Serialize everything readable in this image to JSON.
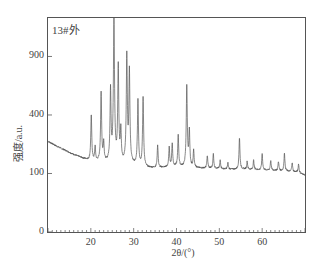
{
  "chart_data": {
    "type": "line",
    "title": "",
    "annotation": "13#外",
    "xlabel": "2θ/(°)",
    "ylabel": "强度/a.u.",
    "xlim": [
      10,
      70
    ],
    "ylim": [
      0,
      1350
    ],
    "yscale": "sqrt",
    "grid": false,
    "legend": null,
    "xticks": [
      20,
      30,
      40,
      50,
      60
    ],
    "yticks": [
      0,
      100,
      400,
      900
    ],
    "series": [
      {
        "name": "13#外",
        "color": "#555555",
        "background": [
          [
            10,
            240
          ],
          [
            12,
            215
          ],
          [
            14,
            195
          ],
          [
            16,
            175
          ],
          [
            18,
            160
          ],
          [
            19.5,
            150
          ],
          [
            21,
            145
          ],
          [
            24,
            140
          ],
          [
            27,
            135
          ],
          [
            30,
            130
          ],
          [
            33,
            120
          ],
          [
            36,
            120
          ],
          [
            40,
            125
          ],
          [
            44,
            120
          ],
          [
            48,
            118
          ],
          [
            52,
            115
          ],
          [
            56,
            115
          ],
          [
            60,
            112
          ],
          [
            64,
            110
          ],
          [
            68,
            105
          ],
          [
            70,
            95
          ]
        ],
        "peaks": [
          {
            "x": 20.1,
            "y": 400
          },
          {
            "x": 21.0,
            "y": 210
          },
          {
            "x": 22.4,
            "y": 570
          },
          {
            "x": 23.0,
            "y": 230
          },
          {
            "x": 24.6,
            "y": 600
          },
          {
            "x": 25.4,
            "y": 1350
          },
          {
            "x": 26.4,
            "y": 820
          },
          {
            "x": 27.0,
            "y": 300
          },
          {
            "x": 28.4,
            "y": 925
          },
          {
            "x": 29.0,
            "y": 770
          },
          {
            "x": 31.0,
            "y": 510
          },
          {
            "x": 32.2,
            "y": 530
          },
          {
            "x": 35.6,
            "y": 220
          },
          {
            "x": 38.3,
            "y": 210
          },
          {
            "x": 39.0,
            "y": 230
          },
          {
            "x": 40.4,
            "y": 275
          },
          {
            "x": 42.4,
            "y": 630
          },
          {
            "x": 43.0,
            "y": 300
          },
          {
            "x": 44.0,
            "y": 195
          },
          {
            "x": 47.2,
            "y": 170
          },
          {
            "x": 48.6,
            "y": 178
          },
          {
            "x": 50.2,
            "y": 150
          },
          {
            "x": 52.0,
            "y": 140
          },
          {
            "x": 54.7,
            "y": 260
          },
          {
            "x": 56.5,
            "y": 145
          },
          {
            "x": 58.0,
            "y": 150
          },
          {
            "x": 60.0,
            "y": 180
          },
          {
            "x": 62.0,
            "y": 150
          },
          {
            "x": 63.8,
            "y": 145
          },
          {
            "x": 65.2,
            "y": 182
          },
          {
            "x": 67.0,
            "y": 140
          },
          {
            "x": 68.5,
            "y": 135
          }
        ]
      }
    ]
  }
}
